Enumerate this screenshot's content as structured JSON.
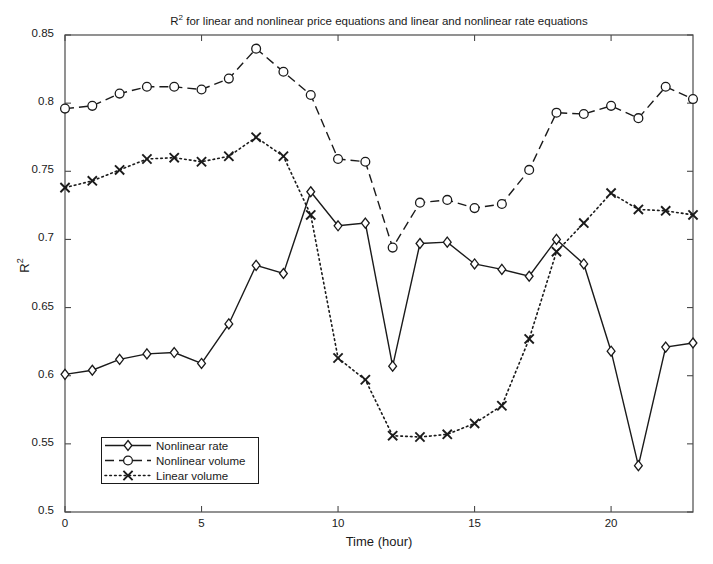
{
  "chart_data": {
    "type": "line",
    "title_prefix": "R",
    "title_sup": "2",
    "title_rest": " for linear and nonlinear price equations and linear and nonlinear rate equations",
    "xlabel": "Time (hour)",
    "ylabel": "R²",
    "ylabel_prefix": "R",
    "ylabel_sup": "2",
    "xlim": [
      0,
      23
    ],
    "ylim": [
      0.5,
      0.85
    ],
    "xticks": [
      0,
      5,
      10,
      15,
      20
    ],
    "xtick_labels": [
      "0",
      "5",
      "10",
      "15",
      "20"
    ],
    "yticks": [
      0.5,
      0.55,
      0.6,
      0.65,
      0.7,
      0.75,
      0.8,
      0.85
    ],
    "ytick_labels": [
      "0.5",
      "0.55",
      "0.6",
      "0.65",
      "0.7",
      "0.75",
      "0.8",
      "0.85"
    ],
    "grid": false,
    "legend_position": "lower left",
    "x": [
      0,
      1,
      2,
      3,
      4,
      5,
      6,
      7,
      8,
      9,
      10,
      11,
      12,
      13,
      14,
      15,
      16,
      17,
      18,
      19,
      20,
      21,
      22,
      23
    ],
    "series": [
      {
        "name": "Nonlinear rate",
        "marker": "diamond",
        "linestyle": "solid",
        "color": "#1a1a1a",
        "values": [
          0.601,
          0.604,
          0.612,
          0.616,
          0.617,
          0.609,
          0.638,
          0.681,
          0.675,
          0.735,
          0.71,
          0.712,
          0.607,
          0.697,
          0.698,
          0.682,
          0.678,
          0.673,
          0.7,
          0.682,
          0.618,
          0.534,
          0.621,
          0.624
        ]
      },
      {
        "name": "Nonlinear volume",
        "marker": "circle",
        "linestyle": "dashed",
        "color": "#1a1a1a",
        "values": [
          0.796,
          0.798,
          0.807,
          0.812,
          0.812,
          0.81,
          0.818,
          0.84,
          0.823,
          0.806,
          0.759,
          0.757,
          0.694,
          0.727,
          0.729,
          0.723,
          0.726,
          0.751,
          0.793,
          0.792,
          0.798,
          0.789,
          0.812,
          0.803
        ]
      },
      {
        "name": "Linear volume",
        "marker": "x",
        "linestyle": "dotted",
        "color": "#1a1a1a",
        "values": [
          0.738,
          0.743,
          0.751,
          0.759,
          0.76,
          0.757,
          0.761,
          0.775,
          0.761,
          0.718,
          0.613,
          0.597,
          0.556,
          0.555,
          0.557,
          0.565,
          0.578,
          0.627,
          0.691,
          0.712,
          0.734,
          0.722,
          0.721,
          0.718
        ]
      }
    ]
  }
}
